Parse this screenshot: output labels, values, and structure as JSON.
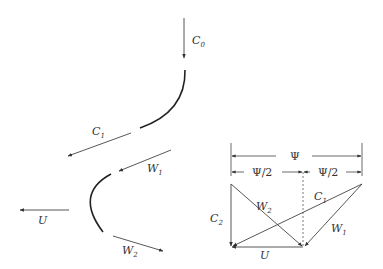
{
  "diagram": {
    "colors": {
      "line": "#444444",
      "blade": "#222222",
      "background": "#ffffff"
    },
    "left": {
      "labels": {
        "c0": "C",
        "c0_sub": "0",
        "c1": "C",
        "c1_sub": "1",
        "w1": "W",
        "w1_sub": "1",
        "u": "U",
        "w2": "W",
        "w2_sub": "2"
      }
    },
    "right": {
      "labels": {
        "psi": "Ψ",
        "psi_half_left": "Ψ/2",
        "psi_half_right": "Ψ/2",
        "c1": "C",
        "c1_sub": "1",
        "w2": "W",
        "w2_sub": "2",
        "c2": "C",
        "c2_sub": "2",
        "w1": "W",
        "w1_sub": "1",
        "u": "U"
      }
    }
  }
}
